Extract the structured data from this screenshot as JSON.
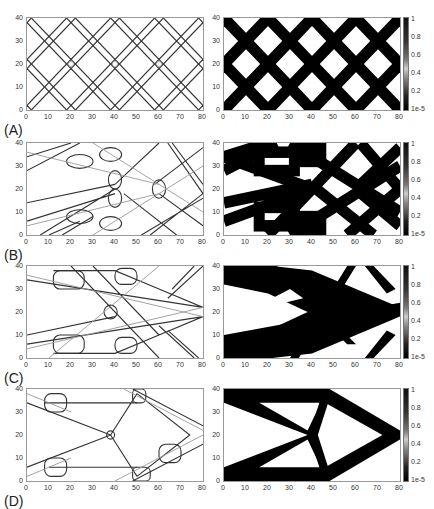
{
  "figure": {
    "panels": [
      {
        "label": "(A)"
      },
      {
        "label": "(B)"
      },
      {
        "label": "(C)"
      },
      {
        "label": "(D)"
      }
    ],
    "x_ticks": [
      "0",
      "10",
      "20",
      "30",
      "40",
      "50",
      "60",
      "70",
      "80"
    ],
    "y_ticks": [
      "40",
      "30",
      "20",
      "10",
      "0"
    ],
    "colorbar_ticks": [
      "1",
      "0.8",
      "0.6",
      "0.4",
      "0.2",
      "1e-5"
    ]
  },
  "chart_data": [
    {
      "type": "heatmap",
      "panel": "A",
      "left": "component layout (outlines)",
      "right": "density field",
      "xlim": [
        0,
        80
      ],
      "ylim": [
        0,
        40
      ],
      "colorbar": [
        1e-05,
        1
      ],
      "description": "Regular diagonal lattice / crisscross pattern"
    },
    {
      "type": "heatmap",
      "panel": "B",
      "left": "component layout (outlines)",
      "right": "density field",
      "xlim": [
        0,
        80
      ],
      "ylim": [
        0,
        40
      ],
      "colorbar": [
        1e-05,
        1
      ],
      "description": "Intermediate optimization iteration"
    },
    {
      "type": "heatmap",
      "panel": "C",
      "left": "component layout (outlines)",
      "right": "density field",
      "xlim": [
        0,
        80
      ],
      "ylim": [
        0,
        40
      ],
      "colorbar": [
        1e-05,
        1
      ],
      "description": "Later iteration, truss emerging"
    },
    {
      "type": "heatmap",
      "panel": "D",
      "left": "component layout (outlines)",
      "right": "density field",
      "xlim": [
        0,
        80
      ],
      "ylim": [
        0,
        40
      ],
      "colorbar": [
        1e-05,
        1
      ],
      "description": "Final cantilever truss topology"
    }
  ]
}
